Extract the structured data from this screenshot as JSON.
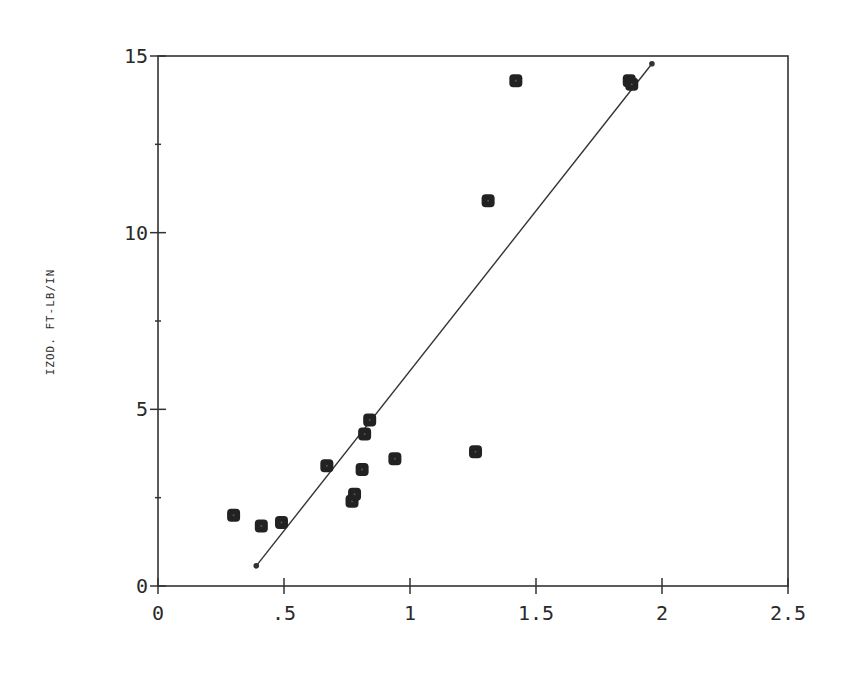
{
  "chart_data": {
    "type": "scatter",
    "title": "",
    "xlabel": "",
    "ylabel": "IZOD. FT-LB/IN",
    "xlim": [
      0,
      2.5
    ],
    "ylim": [
      0,
      15
    ],
    "x_ticks": [
      0,
      0.5,
      1,
      1.5,
      2,
      2.5
    ],
    "x_tick_labels": [
      "0",
      ".5",
      "1",
      "1.5",
      "2",
      "2.5"
    ],
    "y_ticks": [
      0,
      5,
      10,
      15
    ],
    "y_tick_labels": [
      "0",
      "5",
      "10",
      "15"
    ],
    "y_minor_ticks": [
      2.5,
      7.5,
      12.5
    ],
    "grid": false,
    "legend": null,
    "series": [
      {
        "name": "data",
        "marker": "filled-rounded-square",
        "color": "#222222",
        "points": [
          {
            "x": 0.3,
            "y": 2.0
          },
          {
            "x": 0.41,
            "y": 1.7
          },
          {
            "x": 0.49,
            "y": 1.8
          },
          {
            "x": 0.67,
            "y": 3.4
          },
          {
            "x": 0.77,
            "y": 2.4
          },
          {
            "x": 0.78,
            "y": 2.6
          },
          {
            "x": 0.81,
            "y": 3.3
          },
          {
            "x": 0.82,
            "y": 4.3
          },
          {
            "x": 0.84,
            "y": 4.7
          },
          {
            "x": 0.94,
            "y": 3.6
          },
          {
            "x": 1.26,
            "y": 3.8
          },
          {
            "x": 1.31,
            "y": 10.9
          },
          {
            "x": 1.42,
            "y": 14.3
          },
          {
            "x": 1.87,
            "y": 14.3
          },
          {
            "x": 1.88,
            "y": 14.2
          }
        ]
      },
      {
        "name": "fit line",
        "type": "line",
        "color": "#333333",
        "points": [
          {
            "x": 0.39,
            "y": 0.57
          },
          {
            "x": 1.96,
            "y": 14.78
          }
        ]
      }
    ]
  }
}
